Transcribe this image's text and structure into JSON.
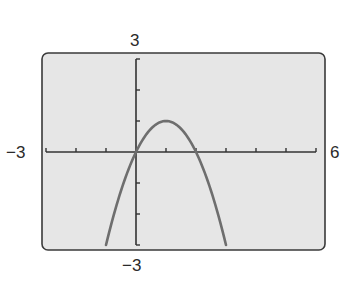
{
  "chart_data": {
    "type": "line",
    "title": "",
    "xlabel": "",
    "ylabel": "",
    "xlim": [
      -3,
      6
    ],
    "ylim": [
      -3,
      3
    ],
    "x_tick_step": 1,
    "y_tick_step": 1,
    "grid": false,
    "window_labels": {
      "xmin": "−3",
      "xmax": "6",
      "ymin": "−3",
      "ymax": "3"
    },
    "series": [
      {
        "name": "y = 2x − x²",
        "x": [
          -1,
          -0.5,
          0,
          0.5,
          1,
          1.5,
          2,
          2.5,
          3
        ],
        "values": [
          -3,
          -1.25,
          0,
          0.75,
          1,
          0.75,
          0,
          -1.25,
          -3
        ]
      }
    ],
    "colors": {
      "frame_bg": "#e6e6e6",
      "curve": "#6e6e6e",
      "axes": "#333333"
    }
  }
}
